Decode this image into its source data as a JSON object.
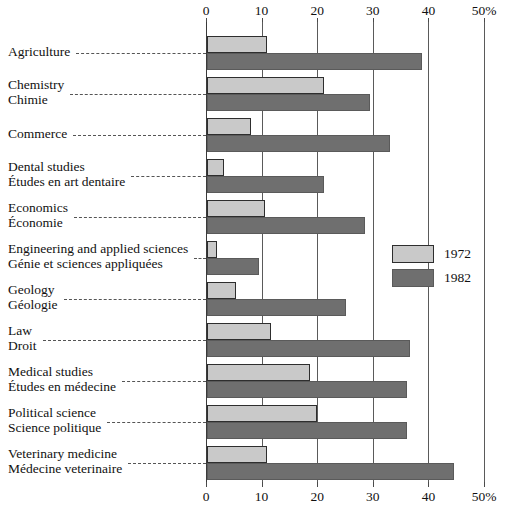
{
  "chart_data": {
    "type": "bar",
    "orientation": "horizontal",
    "title": "",
    "xlabel": "",
    "ylabel": "",
    "xlim": [
      0,
      50
    ],
    "xticks": [
      0,
      10,
      20,
      30,
      40,
      50
    ],
    "xticklabels": [
      "0",
      "10",
      "20",
      "30",
      "40",
      "50%"
    ],
    "grid": true,
    "legend_position": "right-middle",
    "categories": [
      "Agriculture",
      "Chemistry",
      "Commerce",
      "Dental studies",
      "Economics",
      "Engineering and applied sciences",
      "Geology",
      "Law",
      "Medical studies",
      "Political science",
      "Veterinary medicine"
    ],
    "categories_fr": [
      "",
      "Chimie",
      "",
      "Études en art dentaire",
      "Économie",
      "Génie et sciences appliquées",
      "Géologie",
      "Droit",
      "Études en médecine",
      "Science politique",
      "Médecine veterinaire"
    ],
    "series": [
      {
        "name": "1972",
        "color": "#c9c9c9",
        "values": [
          10.8,
          21.0,
          8.0,
          3.0,
          10.5,
          1.8,
          5.3,
          11.5,
          18.5,
          19.7,
          10.8
        ]
      },
      {
        "name": "1982",
        "color": "#6f6f6f",
        "values": [
          38.7,
          29.3,
          33.0,
          21.0,
          28.5,
          9.3,
          25.0,
          36.5,
          36.0,
          36.0,
          44.5
        ]
      }
    ]
  },
  "legend": {
    "items": [
      {
        "label": "1972",
        "color": "#c9c9c9"
      },
      {
        "label": "1982",
        "color": "#6f6f6f"
      }
    ]
  }
}
